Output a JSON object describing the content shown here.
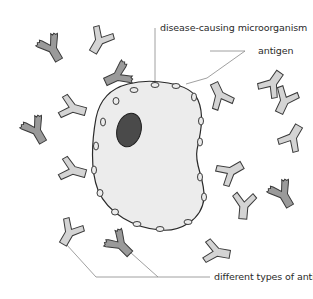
{
  "diagram": {
    "labels": {
      "microorganism": "disease-causing microorganism",
      "antigen": "antigen",
      "antibody": "different types of antibody"
    },
    "colors": {
      "background": "#ffffff",
      "cell_fill": "#ececec",
      "nucleus_fill": "#4a4a4a",
      "antibody_dark": "#9a9a9a",
      "antibody_light": "#d4d4d4",
      "outline": "#3a3a3a",
      "leader_line": "#888888"
    },
    "antibody_count": 16
  }
}
